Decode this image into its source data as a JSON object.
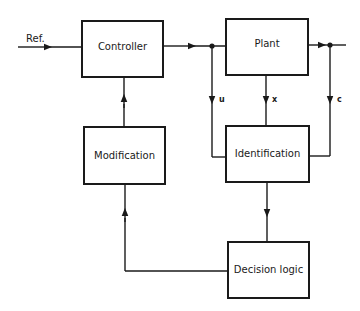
{
  "diagram": {
    "type": "block-diagram",
    "blocks": {
      "controller": "Controller",
      "plant": "Plant",
      "modification": "Modification",
      "identification": "Identification",
      "decision_logic": "Decision logic"
    },
    "signals": {
      "reference": "Ref.",
      "u": "u",
      "x": "x",
      "c": "c"
    },
    "edges": [
      {
        "from": "Ref.",
        "to": "Controller"
      },
      {
        "from": "Controller",
        "to": "Plant"
      },
      {
        "from": "Plant",
        "to": "output"
      },
      {
        "from": "Controller output (u)",
        "to": "Identification"
      },
      {
        "from": "Plant (x)",
        "to": "Identification"
      },
      {
        "from": "Plant output (c)",
        "to": "Identification"
      },
      {
        "from": "Identification",
        "to": "Decision logic"
      },
      {
        "from": "Decision logic",
        "to": "Modification"
      },
      {
        "from": "Modification",
        "to": "Controller"
      }
    ]
  }
}
